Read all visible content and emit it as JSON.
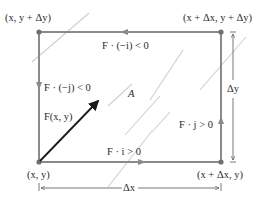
{
  "diagram": {
    "corners": {
      "top_left": "(x, y + Δy)",
      "top_right": "(x + Δx, y + Δy)",
      "bottom_left": "(x, y)",
      "bottom_right": "(x + Δx, y)"
    },
    "edge_labels": {
      "top": "F · (−i) < 0",
      "left": "F · (−j) < 0",
      "bottom": "F · i > 0",
      "right": "F · j > 0"
    },
    "vector_label": "F(x, y)",
    "region_label": "A",
    "dimensions": {
      "width": "Δx",
      "height": "Δy"
    },
    "colors": {
      "rectangle": "#8a8a8a",
      "vector": "#1a1a1a",
      "field_lines": "#c8c8c8",
      "text": "#2a2a2a"
    }
  }
}
